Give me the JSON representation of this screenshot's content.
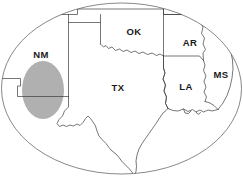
{
  "figure": {
    "type": "map",
    "width": 243,
    "height": 179,
    "background_color": "#ffffff",
    "frame": {
      "shape": "ellipse",
      "center_x": 121.5,
      "center_y": 88.5,
      "radius_x": 120,
      "radius_y": 86,
      "stroke_color": "#555555",
      "fill_color": "#ffffff"
    }
  },
  "labels": {
    "new_mexico": "NM",
    "texas": "TX",
    "oklahoma": "OK",
    "arkansas": "AR",
    "louisiana": "LA",
    "mississippi": "MS"
  },
  "highlight": {
    "name": "permian-basin-highlight",
    "shape": "ellipse",
    "center_x": 43,
    "center_y": 90,
    "radius_x": 21,
    "radius_y": 29,
    "fill_color": "#b0b0b0"
  },
  "colors": {
    "boundary": "#3c3c3c",
    "frame": "#555555",
    "highlight": "#b0b0b0",
    "label_text": "#1a1a1a",
    "background": "#ffffff"
  },
  "label_positions": {
    "new_mexico": {
      "x": 41,
      "y": 55
    },
    "texas": {
      "x": 118,
      "y": 88
    },
    "oklahoma": {
      "x": 134,
      "y": 32
    },
    "arkansas": {
      "x": 190,
      "y": 43
    },
    "louisiana": {
      "x": 186,
      "y": 87
    },
    "mississippi": {
      "x": 221,
      "y": 75
    }
  }
}
